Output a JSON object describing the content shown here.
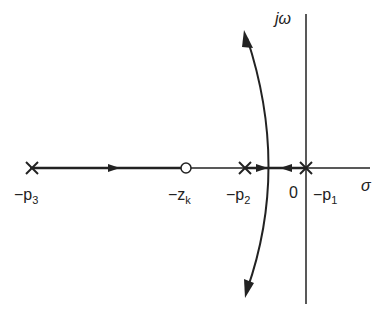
{
  "diagram": {
    "type": "root-locus",
    "axes": {
      "imag_label": "jω",
      "real_label": "σ",
      "origin_label": "0"
    },
    "poles": [
      {
        "label": "−p",
        "subscript": "3"
      },
      {
        "label": "−p",
        "subscript": "2"
      },
      {
        "label": "−p",
        "subscript": "1"
      }
    ],
    "zeros": [
      {
        "label": "−z",
        "subscript": "k"
      }
    ],
    "colors": {
      "line": "#222222",
      "background": "#ffffff"
    }
  }
}
